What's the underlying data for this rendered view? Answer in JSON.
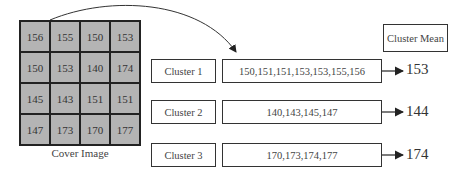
{
  "grid": {
    "caption": "Cover Image",
    "cells": [
      [
        "156",
        "155",
        "150",
        "153"
      ],
      [
        "150",
        "153",
        "140",
        "174"
      ],
      [
        "145",
        "143",
        "151",
        "151"
      ],
      [
        "147",
        "173",
        "170",
        "177"
      ]
    ],
    "fill_color": "#b4b4b4"
  },
  "header": {
    "mean_label": "Cluster Mean"
  },
  "clusters": [
    {
      "label": "Cluster 1",
      "values": "150,151,151,153,153,155,156",
      "mean": "153"
    },
    {
      "label": "Cluster 2",
      "values": "140,143,145,147",
      "mean": "144"
    },
    {
      "label": "Cluster 3",
      "values": "170,173,174,177",
      "mean": "174"
    }
  ]
}
